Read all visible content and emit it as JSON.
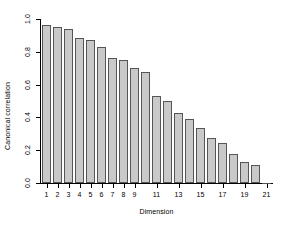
{
  "chart_data": {
    "type": "bar",
    "title": "",
    "subtitle": "",
    "xlabel": "Dimension",
    "ylabel": "Canonical correlation",
    "categories": [
      1,
      2,
      3,
      4,
      5,
      6,
      7,
      8,
      9,
      10,
      11,
      12,
      13,
      14,
      15,
      16,
      17,
      18,
      19,
      20,
      21
    ],
    "values": [
      0.965,
      0.953,
      0.938,
      0.882,
      0.874,
      0.828,
      0.761,
      0.748,
      0.702,
      0.676,
      0.531,
      0.503,
      0.424,
      0.39,
      0.333,
      0.274,
      0.245,
      0.176,
      0.129,
      0.11,
      0.003
    ],
    "ylim": [
      0.0,
      1.0
    ],
    "xlim": [
      0.5,
      21.5
    ],
    "ytick_values": [
      0.0,
      0.2,
      0.4,
      0.6,
      0.8,
      1.0
    ],
    "ytick_labels": [
      "0.0",
      "0.2",
      "0.4",
      "0.6",
      "0.8",
      "1.0"
    ],
    "xtick_values": [
      1,
      2,
      3,
      4,
      5,
      6,
      7,
      8,
      9,
      11,
      13,
      15,
      17,
      19,
      21
    ],
    "xtick_labels": [
      "1",
      "2",
      "3",
      "4",
      "5",
      "6",
      "7",
      "8",
      "9",
      "11",
      "13",
      "15",
      "17",
      "19",
      "21"
    ],
    "grid": false,
    "legend": null,
    "bar_fill_color": "#c9c9c9",
    "bar_border_color": "#555555",
    "axis_color": "#000000",
    "background_color": "#ffffff"
  }
}
